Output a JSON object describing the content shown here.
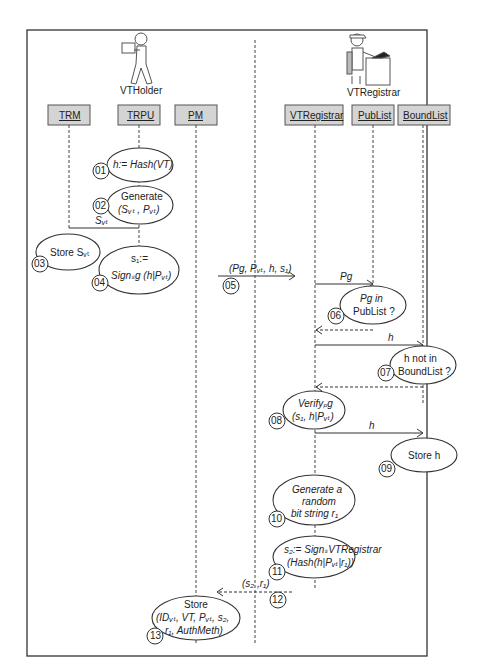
{
  "actors": {
    "holder": {
      "label": "VTHolder"
    },
    "registrar": {
      "label": "VTRegistrar"
    }
  },
  "lifelines": [
    {
      "id": "trm",
      "label": "TRM"
    },
    {
      "id": "trpu",
      "label": "TRPU"
    },
    {
      "id": "pm",
      "label": "PM"
    },
    {
      "id": "vtregistrar",
      "label": "VTRegistrar"
    },
    {
      "id": "publist",
      "label": "PubList"
    },
    {
      "id": "boundlist",
      "label": "BoundList"
    }
  ],
  "steps": [
    {
      "num": "01",
      "lines": [
        "h:= Hash(VT)"
      ]
    },
    {
      "num": "02",
      "lines": [
        "Generate",
        "(Sᵥₜ , Pᵥₜ)"
      ]
    },
    {
      "num": "03",
      "lines": [
        "Store Sᵥₜ"
      ]
    },
    {
      "num": "04",
      "lines": [
        "s₁:=",
        "Signₛg (h|Pᵥₜ)"
      ]
    },
    {
      "num": "05",
      "lines": [
        "(Pg, Pᵥₜ, h, s₁)"
      ]
    },
    {
      "num": "06",
      "lines": [
        "Pg in",
        "PubList ?"
      ]
    },
    {
      "num": "07",
      "lines": [
        "h not in",
        "BoundList ?"
      ]
    },
    {
      "num": "08",
      "lines": [
        "Verifyₚg",
        "(s₁, h|Pᵥₜ)"
      ]
    },
    {
      "num": "09",
      "lines": [
        "Store h"
      ]
    },
    {
      "num": "10",
      "lines": [
        "Generate a",
        "random",
        "bit string r₁"
      ]
    },
    {
      "num": "11",
      "lines": [
        "s₂:= SignₛVTRegistrar",
        "(Hash(h|Pᵥₜ|r₁))"
      ]
    },
    {
      "num": "12",
      "lines": [
        "(s₂ ,r₁)"
      ]
    },
    {
      "num": "13",
      "lines": [
        "Store",
        "(IDᵥₜ, VT, Pᵥₜ, s₂,",
        "r₁, AuthMeth)"
      ]
    }
  ],
  "messages": {
    "svt": "Sᵥₜ",
    "pg": "Pg",
    "h1": "h",
    "h2": "h"
  }
}
